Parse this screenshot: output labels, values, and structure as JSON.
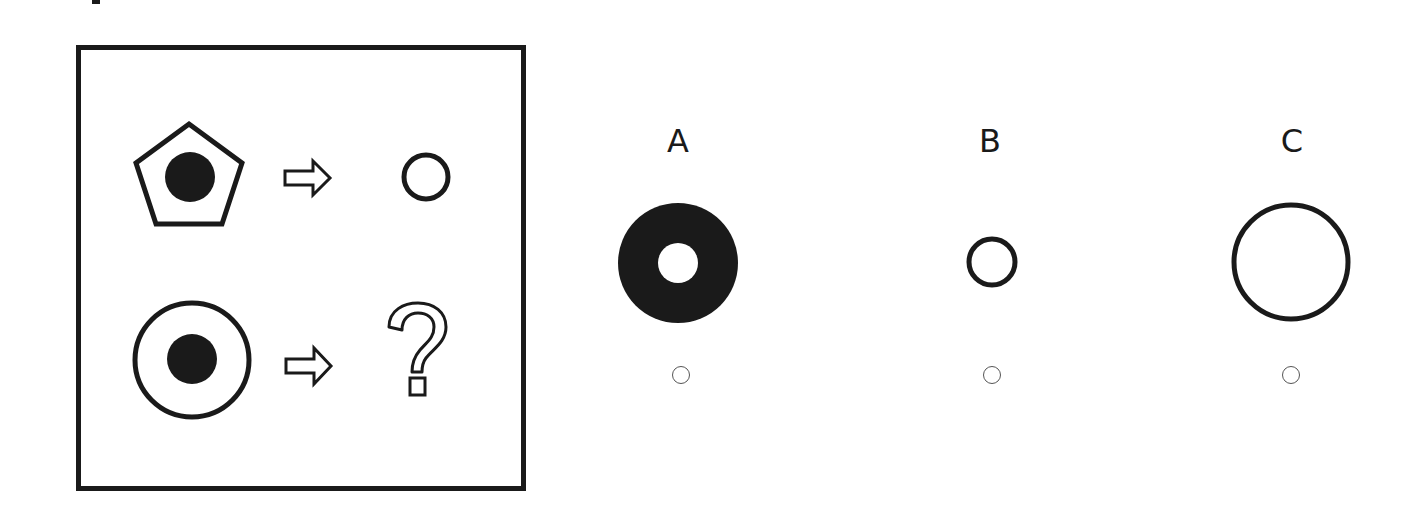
{
  "puzzle": {
    "rows": [
      {
        "input": "pentagon-with-black-dot",
        "arrow": "right-arrow",
        "output": "small-circle"
      },
      {
        "input": "circle-with-black-dot",
        "arrow": "right-arrow",
        "output": "question-mark"
      }
    ]
  },
  "options": [
    {
      "label": "A",
      "shape": "black-ring-with-white-center",
      "selected": false
    },
    {
      "label": "B",
      "shape": "small-circle",
      "selected": false
    },
    {
      "label": "C",
      "shape": "large-circle",
      "selected": false
    }
  ],
  "colors": {
    "ink": "#1a1a1a",
    "radio_border": "#555555",
    "background": "#ffffff"
  }
}
